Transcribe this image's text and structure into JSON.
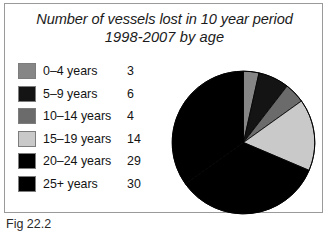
{
  "figure": {
    "caption": "Fig 22.2"
  },
  "chart_data": {
    "type": "pie",
    "title": "Number of vessels lost in 10 year period 1998-2007 by age",
    "title_lines": [
      "Number of vessels lost in 10 year period",
      "1998-2007 by age"
    ],
    "categories": [
      "0–4 years",
      "5–9 years",
      "10–14 years",
      "15–19 years",
      "20–24 years",
      "25+ years"
    ],
    "values": [
      3,
      6,
      4,
      14,
      29,
      30
    ],
    "total": 86,
    "units": "vessels",
    "xlabel": "",
    "ylabel": "",
    "legend_position": "left",
    "grid": false,
    "start_angle_deg": 0,
    "direction": "clockwise",
    "colors": [
      "#868686",
      "#141414",
      "#6b6b6b",
      "#c9c9c9",
      "#000000",
      "#000000"
    ],
    "slice_border": "#000000",
    "slices": [
      {
        "label": "0–4 years",
        "value": 3,
        "color": "#868686",
        "start_deg": 0.0,
        "sweep_deg": 12.56
      },
      {
        "label": "5–9 years",
        "value": 6,
        "color": "#141414",
        "start_deg": 12.56,
        "sweep_deg": 25.12
      },
      {
        "label": "10–14 years",
        "value": 4,
        "color": "#6b6b6b",
        "start_deg": 37.67,
        "sweep_deg": 16.74
      },
      {
        "label": "15–19 years",
        "value": 14,
        "color": "#c9c9c9",
        "start_deg": 54.42,
        "sweep_deg": 58.6
      },
      {
        "label": "20–24 years",
        "value": 29,
        "color": "#000000",
        "start_deg": 113.02,
        "sweep_deg": 121.4
      },
      {
        "label": "25+ years",
        "value": 30,
        "color": "#000000",
        "start_deg": 234.42,
        "sweep_deg": 125.58
      }
    ]
  },
  "legend": {
    "rows": [
      {
        "label": "0–4 years",
        "value": "3",
        "color": "#868686"
      },
      {
        "label": "5–9 years",
        "value": "6",
        "color": "#141414"
      },
      {
        "label": "10–14 years",
        "value": "4",
        "color": "#6b6b6b"
      },
      {
        "label": "15–19 years",
        "value": "14",
        "color": "#c9c9c9"
      },
      {
        "label": "20–24 years",
        "value": "29",
        "color": "#000000"
      },
      {
        "label": "25+ years",
        "value": "30",
        "color": "#000000"
      }
    ]
  }
}
